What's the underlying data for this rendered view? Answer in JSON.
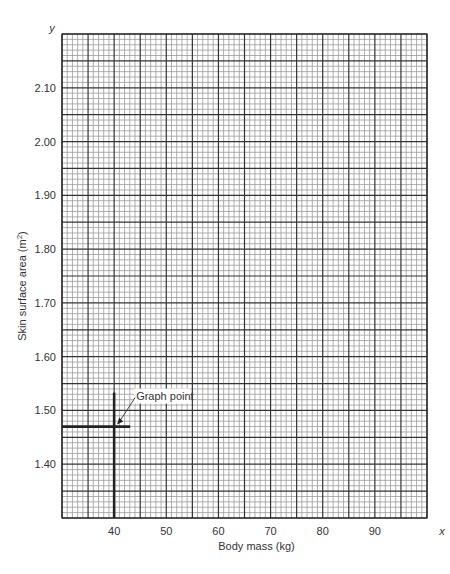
{
  "chart_data": {
    "type": "scatter",
    "title": "",
    "xlabel": "Body mass (kg)",
    "ylabel": "Skin surface area (m²)",
    "ylabel_base": "Skin surface area (m",
    "ylabel_sup": "2",
    "ylabel_end": ")",
    "x_axis_letter": "x",
    "y_axis_letter": "y",
    "xlim": [
      30,
      100
    ],
    "ylim": [
      1.3,
      2.2
    ],
    "x_ticks": [
      40,
      50,
      60,
      70,
      80,
      90
    ],
    "x_tick_labels": [
      "40",
      "50",
      "60",
      "70",
      "80",
      "90"
    ],
    "y_ticks": [
      1.4,
      1.5,
      1.6,
      1.7,
      1.8,
      1.9,
      2.0,
      2.1
    ],
    "y_tick_labels": [
      "1.40",
      "1.50",
      "1.60",
      "1.70",
      "1.80",
      "1.90",
      "2.00",
      "2.10"
    ],
    "grid": true,
    "grid_minor_x_step": 1,
    "grid_major_x_step": 5,
    "grid_minor_y_step": 0.01,
    "grid_major_y_step": 0.05,
    "points": [
      {
        "x": 40,
        "y": 1.47,
        "label": "Graph point"
      }
    ]
  }
}
